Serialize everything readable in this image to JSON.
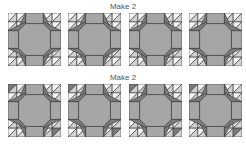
{
  "rows": [
    {
      "title": "Make 2",
      "variant": "A"
    },
    {
      "title": "Make 2",
      "variant": "B"
    }
  ],
  "colors": {
    "white": "#f4f4f4",
    "light": "#d2d2d2",
    "medium": "#a6a6a6",
    "dark": "#7a7a7a",
    "stroke": "#333333"
  }
}
